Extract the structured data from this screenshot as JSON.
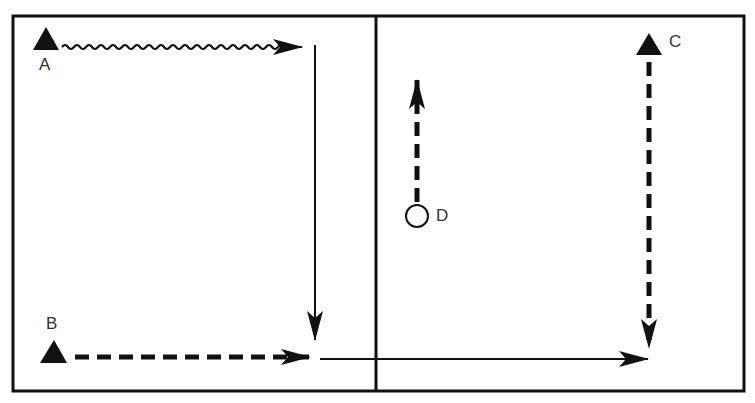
{
  "diagram": {
    "colors": {
      "ink": "#111111",
      "background": "#ffffff"
    },
    "players": [
      {
        "id": "A",
        "label": "A",
        "shape": "triangle",
        "x": 46,
        "y": 42
      },
      {
        "id": "B",
        "label": "B",
        "shape": "triangle",
        "x": 54,
        "y": 352
      },
      {
        "id": "C",
        "label": "C",
        "shape": "triangle",
        "x": 649,
        "y": 45
      },
      {
        "id": "D",
        "label": "D",
        "shape": "circle",
        "x": 417,
        "y": 216
      }
    ],
    "paths": [
      {
        "from": "A",
        "style": "wavy",
        "desc": "A dribbles right"
      },
      {
        "from": "A-corner",
        "style": "solid",
        "desc": "pass down"
      },
      {
        "from": "B",
        "style": "dashed",
        "desc": "B runs right"
      },
      {
        "from": "B-end",
        "style": "solid",
        "desc": "pass right into right court"
      },
      {
        "from": "C",
        "style": "dashed",
        "desc": "C runs down"
      },
      {
        "from": "D",
        "style": "dashed",
        "desc": "D runs up"
      }
    ]
  }
}
